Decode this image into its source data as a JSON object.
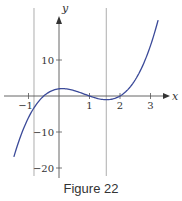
{
  "chart_data": {
    "type": "line",
    "title": "",
    "caption": "Figure 22",
    "xlabel": "x",
    "ylabel": "y",
    "xlim": [
      -1.9,
      3.8
    ],
    "ylim": [
      -21,
      25
    ],
    "x_ticks": [
      -1,
      1,
      2,
      3
    ],
    "x_tick_labels": [
      "-1",
      "1",
      "2",
      "3"
    ],
    "y_ticks": [
      10,
      -10,
      -20
    ],
    "y_tick_labels": [
      "10",
      "-10",
      "-20"
    ],
    "vertical_reference_lines": [
      -0.82,
      1.55
    ],
    "grid": false,
    "legend": null,
    "series": [
      {
        "name": "f(x)",
        "color": "#3b4a99",
        "x": [
          -1.48,
          -1.25,
          -1.0,
          -0.75,
          -0.5,
          -0.25,
          0.0,
          0.25,
          0.5,
          0.75,
          1.0,
          1.25,
          1.5,
          1.75,
          2.0,
          2.25,
          2.5,
          2.75,
          3.0,
          3.25
        ],
        "y": [
          -19.6,
          -12.0,
          -6.0,
          -2.9,
          0.0,
          1.2,
          2.0,
          1.6,
          1.0,
          0.3,
          0.0,
          -0.8,
          -1.0,
          -0.9,
          0.0,
          1.4,
          3.0,
          6.6,
          14.0,
          21.1
        ]
      }
    ]
  },
  "figure": {
    "caption": "Figure 22",
    "x_axis_label": "x",
    "y_axis_label": "y"
  }
}
